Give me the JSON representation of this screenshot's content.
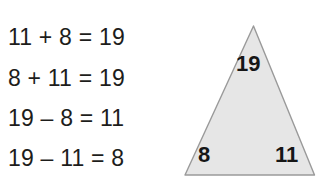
{
  "worksheet": {
    "equations": [
      {
        "id": "addition-1",
        "text": "11 + 8 = 19"
      },
      {
        "id": "addition-2",
        "text": "8 + 11 = 19"
      },
      {
        "id": "subtraction-1",
        "text": "19 – 8 = 11"
      },
      {
        "id": "subtraction-2",
        "text": "19 – 11 = 8"
      }
    ],
    "triangle": {
      "top_value": "19",
      "bottom_left_value": "8",
      "bottom_right_value": "11",
      "fill_color": "#e6e6e6",
      "stroke_color": "#9a9a9a"
    },
    "background_color": "#ffffff",
    "text_color": "#1d1d1b"
  }
}
